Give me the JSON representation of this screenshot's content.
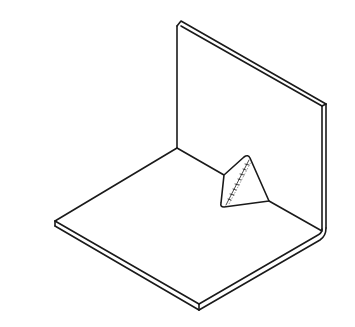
{
  "diagram": {
    "type": "isometric line drawing",
    "colors": {
      "background": "#ffffff",
      "line": "#1a1a1a"
    },
    "parts": [
      {
        "name": "vertical-plate",
        "label": ""
      },
      {
        "name": "base-plate",
        "label": ""
      },
      {
        "name": "gusset-weld",
        "label": ""
      }
    ]
  }
}
